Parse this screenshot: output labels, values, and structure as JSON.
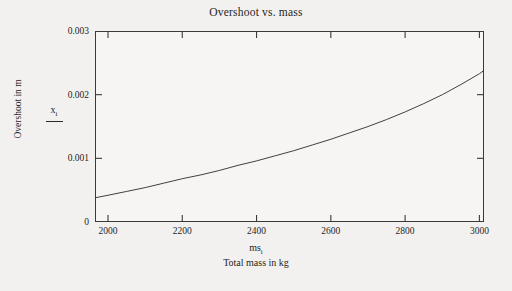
{
  "chart_data": {
    "type": "line",
    "title": "Overshoot vs. mass",
    "xlabel": "Total mass in kg",
    "ylabel": "Overshoot in m",
    "x_variable": "ms",
    "x_variable_subscript": "i",
    "y_variable": "x",
    "y_variable_subscript": "i",
    "xlim": [
      1965,
      3012
    ],
    "ylim": [
      0,
      0.003
    ],
    "xticks": [
      2000,
      2200,
      2400,
      2600,
      2800,
      3000
    ],
    "xtick_labels": [
      "2000",
      "2200",
      "2400",
      "2600",
      "2800",
      "3000"
    ],
    "yticks": [
      0,
      0.001,
      0.002,
      0.003
    ],
    "ytick_labels": [
      "0",
      "0.001",
      "0.002",
      "0.003"
    ],
    "grid": false,
    "legend": "none",
    "line_color": "#2b2b2b",
    "series": [
      {
        "name": "x_i",
        "x": [
          1965,
          2000,
          2050,
          2100,
          2150,
          2200,
          2250,
          2300,
          2350,
          2400,
          2450,
          2500,
          2550,
          2600,
          2650,
          2700,
          2750,
          2800,
          2850,
          2900,
          2950,
          3000,
          3012
        ],
        "values": [
          0.00038,
          0.00042,
          0.00048,
          0.00054,
          0.00061,
          0.00068,
          0.00074,
          0.00081,
          0.00089,
          0.00096,
          0.00104,
          0.00112,
          0.00121,
          0.0013,
          0.0014,
          0.0015,
          0.00161,
          0.00173,
          0.00186,
          0.002,
          0.00216,
          0.00233,
          0.00238
        ]
      }
    ],
    "note_shape": "monotonically increasing, slightly convex curve"
  },
  "figure": {
    "background_color": "#f2f1ef",
    "plot_background_color": "#f6f5f3",
    "frame_color": "#3a3a3a"
  }
}
